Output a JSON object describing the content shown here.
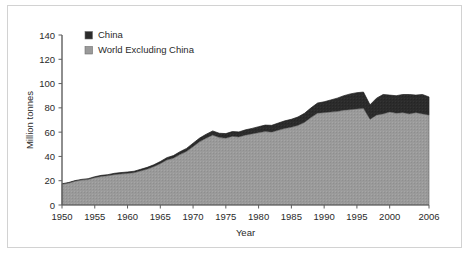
{
  "chart_data": {
    "type": "area",
    "stacked": true,
    "title": "",
    "xlabel": "Year",
    "ylabel": "Million tonnes",
    "xlim": [
      1950,
      2006
    ],
    "ylim": [
      0,
      140
    ],
    "ytick_step": 20,
    "xtick_step": 5,
    "grid": false,
    "legend_position": "top-left",
    "x": [
      1950,
      1951,
      1952,
      1953,
      1954,
      1955,
      1956,
      1957,
      1958,
      1959,
      1960,
      1961,
      1962,
      1963,
      1964,
      1965,
      1966,
      1967,
      1968,
      1969,
      1970,
      1971,
      1972,
      1973,
      1974,
      1975,
      1976,
      1977,
      1978,
      1979,
      1980,
      1981,
      1982,
      1983,
      1984,
      1985,
      1986,
      1987,
      1988,
      1989,
      1990,
      1991,
      1992,
      1993,
      1994,
      1995,
      1996,
      1997,
      1998,
      1999,
      2000,
      2001,
      2002,
      2003,
      2004,
      2005,
      2006
    ],
    "series": [
      {
        "name": "World Excluding China",
        "color": "#9a9a9a",
        "values": [
          17,
          18,
          19.5,
          20.5,
          21,
          22.5,
          23.5,
          24,
          25,
          25.5,
          26,
          26.5,
          28,
          29.5,
          31.5,
          34,
          37,
          38.5,
          41.5,
          44,
          48,
          52,
          55,
          57.5,
          55.5,
          55,
          56.5,
          56,
          57.5,
          58.5,
          59.5,
          60.5,
          60,
          61.5,
          63,
          64,
          65.5,
          68,
          72,
          75.5,
          76,
          76.5,
          77,
          78,
          78.5,
          79,
          79.5,
          70.5,
          74,
          75,
          76.5,
          75.5,
          76,
          75,
          76,
          75,
          74
        ]
      },
      {
        "name": "China",
        "color": "#2b2b2b",
        "values": [
          0.5,
          0.5,
          0.6,
          0.6,
          0.7,
          0.8,
          0.9,
          1,
          1.1,
          1.2,
          1.2,
          1.3,
          1.4,
          1.5,
          1.6,
          1.8,
          2,
          2.2,
          2.4,
          2.6,
          2.9,
          3.1,
          3.3,
          3.5,
          3.6,
          3.8,
          4,
          4.2,
          4.4,
          4.6,
          5,
          5.3,
          5.6,
          6,
          6.3,
          6.6,
          7,
          7.5,
          8,
          8.5,
          9,
          10,
          11,
          12,
          13,
          13.5,
          13.5,
          12,
          14,
          16,
          14,
          14.5,
          15,
          16,
          14.5,
          16,
          15
        ]
      }
    ],
    "ytick_labels": [
      "0",
      "20",
      "40",
      "60",
      "80",
      "100",
      "120",
      "140"
    ],
    "xtick_labels": [
      "1950",
      "1955",
      "1960",
      "1965",
      "1970",
      "1975",
      "1980",
      "1985",
      "1990",
      "1995",
      "2000",
      "2006"
    ],
    "xtick_values": [
      1950,
      1955,
      1960,
      1965,
      1970,
      1975,
      1980,
      1985,
      1990,
      1995,
      2000,
      2006
    ]
  },
  "legend": {
    "entries": [
      {
        "label": "China",
        "color": "#2b2b2b"
      },
      {
        "label": "World Excluding China",
        "color": "#9a9a9a"
      }
    ]
  }
}
